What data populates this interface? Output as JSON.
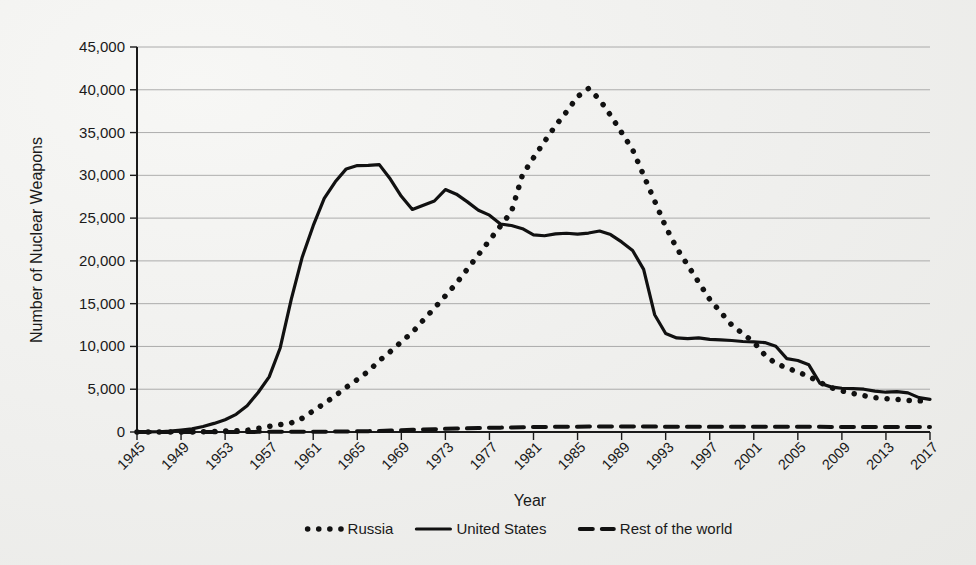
{
  "chart_data": {
    "type": "line",
    "title": "",
    "xlabel": "Year",
    "ylabel": "Number of Nuclear Weapons",
    "xlim": [
      1945,
      2017
    ],
    "ylim": [
      0,
      45000
    ],
    "grid": true,
    "legend_position": "bottom",
    "y_ticks": [
      0,
      5000,
      10000,
      15000,
      20000,
      25000,
      30000,
      35000,
      40000,
      45000
    ],
    "y_tick_labels": [
      "0",
      "5,000",
      "10,000",
      "15,000",
      "20,000",
      "25,000",
      "30,000",
      "35,000",
      "40,000",
      "45,000"
    ],
    "x_ticks": [
      1945,
      1949,
      1953,
      1957,
      1961,
      1965,
      1969,
      1973,
      1977,
      1981,
      1985,
      1989,
      1993,
      1997,
      2001,
      2005,
      2009,
      2013,
      2017
    ],
    "x_tick_labels": [
      "1945",
      "1949",
      "1953",
      "1957",
      "1961",
      "1965",
      "1969",
      "1973",
      "1977",
      "1981",
      "1985",
      "1989",
      "1993",
      "1997",
      "2001",
      "2005",
      "2009",
      "2013",
      "2017"
    ],
    "x": [
      1945,
      1946,
      1947,
      1948,
      1949,
      1950,
      1951,
      1952,
      1953,
      1954,
      1955,
      1956,
      1957,
      1958,
      1959,
      1960,
      1961,
      1962,
      1963,
      1964,
      1965,
      1966,
      1967,
      1968,
      1969,
      1970,
      1971,
      1972,
      1973,
      1974,
      1975,
      1976,
      1977,
      1978,
      1979,
      1980,
      1981,
      1982,
      1983,
      1984,
      1985,
      1986,
      1987,
      1988,
      1989,
      1990,
      1991,
      1992,
      1993,
      1994,
      1995,
      1996,
      1997,
      1998,
      1999,
      2000,
      2001,
      2002,
      2003,
      2004,
      2005,
      2006,
      2007,
      2008,
      2009,
      2010,
      2011,
      2012,
      2013,
      2014,
      2015,
      2016,
      2017
    ],
    "series": [
      {
        "name": "Russia",
        "style": "dotted",
        "values": [
          0,
          0,
          0,
          0,
          1,
          5,
          25,
          50,
          120,
          150,
          200,
          426,
          660,
          869,
          1060,
          1605,
          2471,
          3322,
          4238,
          5221,
          6129,
          7089,
          8339,
          9399,
          10538,
          11643,
          13092,
          14478,
          15915,
          17385,
          19055,
          20723,
          22399,
          24078,
          25752,
          30062,
          32049,
          33952,
          35804,
          37431,
          39197,
          40159,
          38859,
          37000,
          35000,
          33000,
          30000,
          27000,
          24000,
          21500,
          19500,
          17500,
          15500,
          14000,
          12500,
          11500,
          10500,
          9000,
          8000,
          7500,
          7000,
          6500,
          5800,
          5200,
          4800,
          4500,
          4250,
          4000,
          3900,
          3800,
          3700,
          3650,
          3600
        ]
      },
      {
        "name": "United States",
        "style": "solid",
        "values": [
          6,
          11,
          32,
          110,
          235,
          369,
          640,
          1005,
          1436,
          2063,
          3057,
          4618,
          6444,
          9822,
          15468,
          20434,
          24111,
          27297,
          29249,
          30751,
          31139,
          31175,
          31255,
          29561,
          27552,
          26008,
          26516,
          27000,
          28335,
          27800,
          26900,
          25914,
          25346,
          24313,
          24138,
          23764,
          23031,
          22937,
          23154,
          23228,
          23135,
          23254,
          23490,
          23077,
          22217,
          21211,
          19008,
          13708,
          11511,
          11000,
          10904,
          11000,
          10829,
          10763,
          10695,
          10577,
          10526,
          10457,
          10027,
          8570,
          8360,
          7853,
          5709,
          5273,
          5113,
          5066,
          5000,
          4785,
          4650,
          4717,
          4571,
          4018,
          3822
        ]
      },
      {
        "name": "Rest of the world",
        "style": "dashed",
        "values": [
          0,
          0,
          0,
          0,
          0,
          0,
          0,
          1,
          1,
          2,
          10,
          15,
          20,
          22,
          25,
          30,
          35,
          40,
          50,
          65,
          80,
          100,
          130,
          170,
          210,
          250,
          290,
          330,
          370,
          400,
          430,
          460,
          490,
          510,
          530,
          555,
          575,
          590,
          605,
          615,
          625,
          635,
          645,
          650,
          650,
          645,
          640,
          630,
          620,
          615,
          610,
          605,
          600,
          605,
          610,
          615,
          620,
          620,
          615,
          610,
          605,
          600,
          600,
          595,
          595,
          590,
          590,
          585,
          585,
          580,
          580,
          575,
          575
        ]
      }
    ]
  },
  "legend": {
    "items": [
      {
        "label": "Russia",
        "marker": "dotted-marker"
      },
      {
        "label": "United States",
        "marker": "solid-marker"
      },
      {
        "label": "Rest of the world",
        "marker": "dashed-marker"
      }
    ]
  }
}
